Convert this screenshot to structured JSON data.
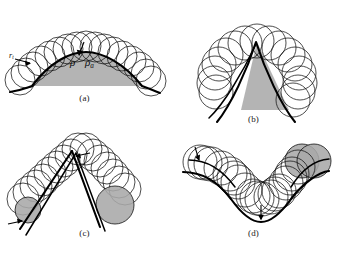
{
  "figure": {
    "background_color": "#ffffff",
    "ink_color": "#111111",
    "gray_fill_color": "#b0b0b0",
    "gray_circle_color": "#a8a8a8",
    "panels": [
      {
        "id": "a",
        "caption": "(a)",
        "description": "Convex arc with a family of circles of radius rho rolling along the outside of the curve; the region under the arc is shaded gray.",
        "labels": [
          {
            "name": "rho",
            "text": "ρ"
          },
          {
            "name": "rho-a",
            "text": "ρ",
            "subscript": "a"
          },
          {
            "name": "r-t",
            "text": "r",
            "subscript": "t"
          }
        ],
        "shaded": true,
        "circle_count": 17
      },
      {
        "id": "b",
        "caption": "(b)",
        "description": "Sharp convex cusp (peak) with circles rolling over the apex, forming a dome; the wedge under the cusp is shaded gray.",
        "labels": [],
        "shaded": true,
        "circle_count": 16
      },
      {
        "id": "c",
        "caption": "(c)",
        "description": "Inverted-V peak with circles rolling down both flanks; one circle at the lower right is filled gray.",
        "labels": [
          {
            "name": "rho",
            "text": "ρ"
          }
        ],
        "shaded": false,
        "circle_count": 20
      },
      {
        "id": "d",
        "caption": "(d)",
        "description": "Smooth valley (concave notch) with circles rolling through the trough; circles at the upper right are filled gray, and rho marks the radius at the valley bottom.",
        "labels": [
          {
            "name": "rho",
            "text": "ρ"
          }
        ],
        "shaded": false,
        "circle_count": 18
      }
    ]
  },
  "labels": {
    "panel_a_caption": "(a)",
    "panel_b_caption": "(b)",
    "panel_c_caption": "(c)",
    "panel_d_caption": "(d)",
    "rho": "ρ",
    "rho_a_base": "ρ",
    "rho_a_sub": "a",
    "r_t_base": "r",
    "r_t_sub": "t"
  }
}
